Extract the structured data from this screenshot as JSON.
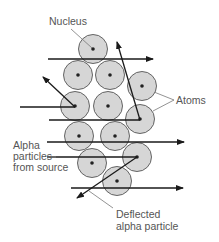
{
  "colors": {
    "atom_fill": "#d6d6d6",
    "atom_stroke": "#555555",
    "nucleus": "#222222",
    "arrow": "#1a1a1a",
    "label": "#555555",
    "pointer": "#777777"
  },
  "labels": {
    "nucleus": "Nucleus",
    "atoms": "Atoms",
    "alpha_source": [
      "Alpha",
      "particles",
      "from source"
    ],
    "deflected": [
      "Deflected",
      "alpha particle"
    ]
  },
  "atoms": [
    {
      "cx": 93,
      "cy": 49
    },
    {
      "cx": 78,
      "cy": 75
    },
    {
      "cx": 110,
      "cy": 75
    },
    {
      "cx": 142,
      "cy": 86
    },
    {
      "cx": 75,
      "cy": 106
    },
    {
      "cx": 108,
      "cy": 106
    },
    {
      "cx": 140,
      "cy": 119
    },
    {
      "cx": 79,
      "cy": 136
    },
    {
      "cx": 115,
      "cy": 136
    },
    {
      "cx": 92,
      "cy": 163
    },
    {
      "cx": 137,
      "cy": 157
    },
    {
      "cx": 117,
      "cy": 181
    }
  ],
  "atom_radius": 14.5,
  "paths": [
    {
      "kind": "straight",
      "x1": 48,
      "y1": 59,
      "x2": 153,
      "y2": 59
    },
    {
      "kind": "incoming",
      "x1": 20,
      "y1": 107,
      "x2": 75,
      "y2": 107
    },
    {
      "kind": "deflected",
      "x1": 75,
      "y1": 107,
      "x2": 43,
      "y2": 77
    },
    {
      "kind": "incoming",
      "x1": 49,
      "y1": 120,
      "x2": 140,
      "y2": 120
    },
    {
      "kind": "deflected",
      "x1": 140,
      "y1": 120,
      "x2": 117,
      "y2": 42
    },
    {
      "kind": "straight",
      "x1": 47,
      "y1": 142,
      "x2": 184,
      "y2": 142
    },
    {
      "kind": "incoming",
      "x1": 56,
      "y1": 157,
      "x2": 137,
      "y2": 157
    },
    {
      "kind": "deflected",
      "x1": 137,
      "y1": 157,
      "x2": 77,
      "y2": 198
    },
    {
      "kind": "straight",
      "x1": 71,
      "y1": 188,
      "x2": 183,
      "y2": 188
    }
  ]
}
